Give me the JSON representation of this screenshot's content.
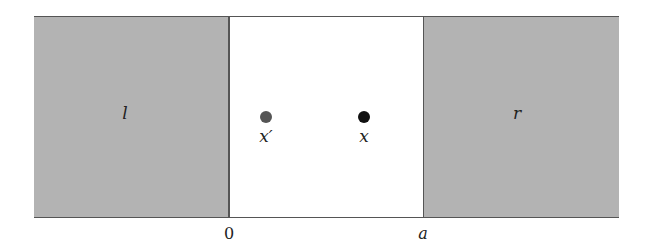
{
  "diagram": {
    "regions": [
      {
        "id": "left",
        "label": "l",
        "fill": "#b3b3b3"
      },
      {
        "id": "middle",
        "label": "",
        "fill": "#ffffff"
      },
      {
        "id": "right",
        "label": "r",
        "fill": "#b3b3b3"
      }
    ],
    "points": [
      {
        "id": "x-prime",
        "label": "x′",
        "color": "#555555"
      },
      {
        "id": "x",
        "label": "x",
        "color": "#111111"
      }
    ],
    "axis_ticks": [
      {
        "label": "0"
      },
      {
        "label": "a"
      }
    ]
  }
}
